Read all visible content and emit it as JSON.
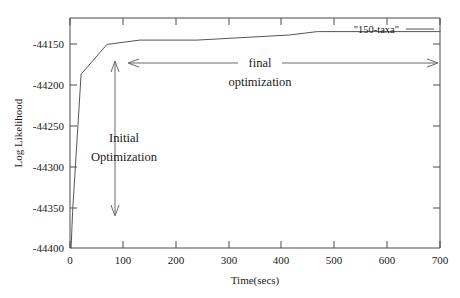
{
  "chart_data": {
    "type": "line",
    "title": "",
    "xlabel": "Time(secs)",
    "ylabel": "Log Likelihood",
    "xlim": [
      0,
      700
    ],
    "ylim": [
      -44400,
      -44130
    ],
    "xticks": [
      0,
      100,
      200,
      300,
      400,
      500,
      600,
      700
    ],
    "xtick_labels": [
      "0",
      "100",
      "200",
      "300",
      "400",
      "500",
      "600",
      "700"
    ],
    "yticks": [
      -44400,
      -44350,
      -44300,
      -44250,
      -44200,
      -44150
    ],
    "ytick_labels": [
      "-44400",
      "-44350",
      "-44300",
      "-44250",
      "-44200",
      "-44150"
    ],
    "grid": false,
    "legend_position": "top-right",
    "series": [
      {
        "name": "\"150-taxa\"",
        "color": "#555555",
        "x": [
          2,
          5,
          21,
          70,
          132,
          240,
          415,
          468,
          560,
          700
        ],
        "y": [
          -44400,
          -44357,
          -44196,
          -44161,
          -44156,
          -44156,
          -44150,
          -44146,
          -44146,
          -44146
        ]
      }
    ],
    "annotations": [
      {
        "name": "initial-optimization",
        "label_line1": "Initial",
        "label_line2": "Optimization",
        "arrow": "vertical-double",
        "x": 85,
        "y_top": -44165,
        "y_bottom": -44364
      },
      {
        "name": "final-optimization",
        "label_line1": "final",
        "label_line2": "optimization",
        "arrow": "horizontal-double",
        "x_left": 110,
        "x_right": 700,
        "y": -44167
      }
    ]
  },
  "legend": {
    "entries": [
      {
        "label": "\"150-taxa\"",
        "color": "#555555"
      }
    ]
  },
  "axes": {
    "x_title": "Time(secs)",
    "y_title": "Log Likelihood"
  }
}
